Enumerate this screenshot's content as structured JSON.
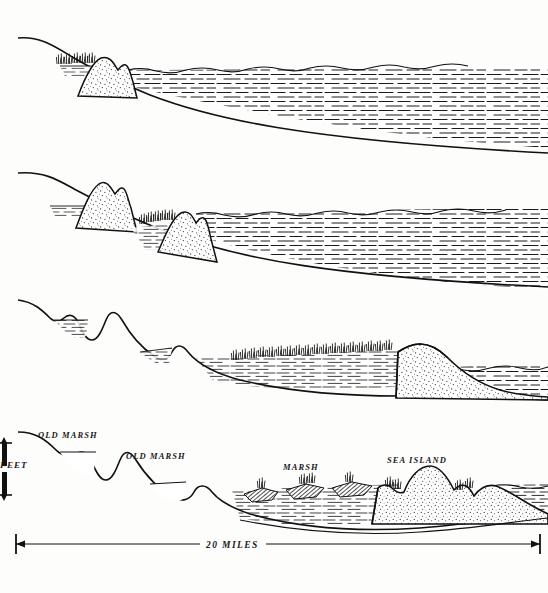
{
  "figure": {
    "panel_count": 4,
    "background_color": "#fdfdfc",
    "ink_color": "#111111"
  },
  "labels": {
    "old_marsh_1": "OLD MARSH",
    "old_marsh_2": "OLD MARSH",
    "marsh": "MARSH",
    "sea_island": "SEA ISLAND",
    "feet_axis": "FEET",
    "scale_distance": "20 MILES"
  },
  "panels": [
    {
      "index": 1,
      "name": "panel-stage-1",
      "features": [
        "sloping-shore",
        "vegetation-tuft",
        "stippled-dune",
        "open-water"
      ]
    },
    {
      "index": 2,
      "name": "panel-stage-2",
      "features": [
        "sloping-shore",
        "stippled-dune",
        "lagoon",
        "vegetation-tuft",
        "stippled-dune",
        "open-water"
      ]
    },
    {
      "index": 3,
      "name": "panel-stage-3",
      "features": [
        "eroded-dune-remnant",
        "old-marsh-basin",
        "old-marsh-basin",
        "marsh-vegetation",
        "barrier-island",
        "open-water"
      ]
    },
    {
      "index": 4,
      "name": "panel-stage-4",
      "features": [
        "old-marsh-basin",
        "old-marsh-basin",
        "marsh-hummocks",
        "sea-island-dunes",
        "open-water",
        "scale-bar"
      ]
    }
  ],
  "scale": {
    "horizontal_label": "20 MILES",
    "vertical_label": "FEET",
    "arrow_style": "double-headed"
  }
}
